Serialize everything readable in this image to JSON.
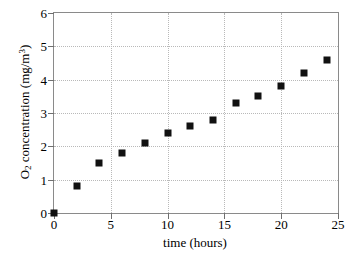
{
  "chart_data": {
    "type": "scatter",
    "title": "",
    "xlabel": "time (hours)",
    "ylabel_parts": {
      "lead": "O",
      "sub": "2",
      "mid": " concentration (mg/m",
      "sup": "3",
      "tail": ")"
    },
    "ylabel": "O2 concentration (mg/m3)",
    "xlim": [
      0,
      25
    ],
    "ylim": [
      0,
      6
    ],
    "xticks": [
      0,
      5,
      10,
      15,
      20,
      25
    ],
    "yticks": [
      0,
      1,
      2,
      3,
      4,
      5,
      6
    ],
    "xtick_labels": [
      "0",
      "5",
      "10",
      "15",
      "20",
      "25"
    ],
    "ytick_labels": [
      "0",
      "1",
      "2",
      "3",
      "4",
      "5",
      "6"
    ],
    "grid": true,
    "grid_style": "dotted",
    "legend": null,
    "marker": "square",
    "marker_color": "#111111",
    "marker_size_px": 7,
    "x": [
      0,
      2,
      4,
      6,
      8,
      10,
      12,
      14,
      16,
      18,
      20,
      22,
      24
    ],
    "values": [
      0.0,
      0.8,
      1.5,
      1.8,
      2.1,
      2.4,
      2.6,
      2.8,
      3.3,
      3.5,
      3.8,
      4.2,
      4.6
    ],
    "points": [
      {
        "x": 0,
        "y": 0.0
      },
      {
        "x": 2,
        "y": 0.8
      },
      {
        "x": 4,
        "y": 1.5
      },
      {
        "x": 6,
        "y": 1.8
      },
      {
        "x": 8,
        "y": 2.1
      },
      {
        "x": 10,
        "y": 2.4
      },
      {
        "x": 12,
        "y": 2.6
      },
      {
        "x": 14,
        "y": 2.8
      },
      {
        "x": 16,
        "y": 3.3
      },
      {
        "x": 18,
        "y": 3.5
      },
      {
        "x": 20,
        "y": 3.8
      },
      {
        "x": 22,
        "y": 4.2
      },
      {
        "x": 24,
        "y": 4.6
      }
    ]
  },
  "colors": {
    "marker": "#111111",
    "axis": "#8a8a8a",
    "grid": "#b9b9b9",
    "background": "#ffffff",
    "text": "#000000"
  }
}
